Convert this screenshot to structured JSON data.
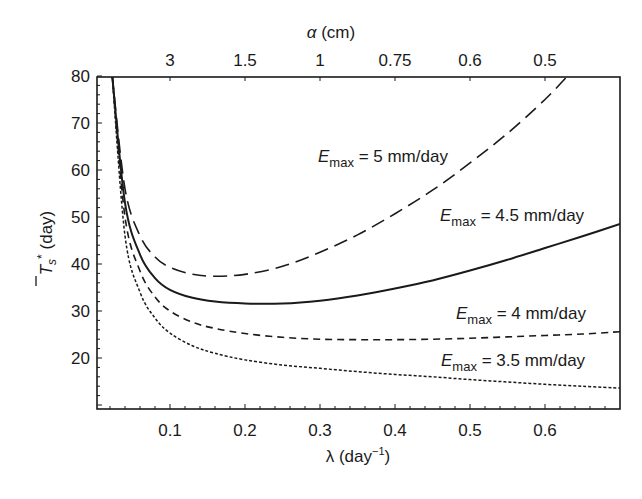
{
  "chart_data": {
    "type": "line",
    "title": "",
    "xlabel": "λ (day⁻¹)",
    "ylabel": "T̄s* (day)",
    "top_xlabel": "α (cm)",
    "xlim": [
      0.003,
      0.7
    ],
    "ylim": [
      9.3,
      80
    ],
    "grid": false,
    "legend_position": "inline labels",
    "x_ticks": [
      0.1,
      0.2,
      0.3,
      0.4,
      0.5,
      0.6
    ],
    "x_tick_labels": [
      "0.1",
      "0.2",
      "0.3",
      "0.4",
      "0.5",
      "0.6"
    ],
    "y_ticks": [
      20,
      30,
      40,
      50,
      60,
      70,
      80
    ],
    "y_tick_labels": [
      "20",
      "30",
      "40",
      "50",
      "60",
      "70",
      "80"
    ],
    "top_x_tick_labels": [
      "3",
      "1.5",
      "1",
      "0.75",
      "0.6",
      "0.5"
    ],
    "series": [
      {
        "name": "Emax = 5 mm/day",
        "style": "long-dash",
        "x": [
          0.023,
          0.04,
          0.06,
          0.08,
          0.1,
          0.13,
          0.16,
          0.2,
          0.25,
          0.3,
          0.35,
          0.4,
          0.45,
          0.5,
          0.55,
          0.6,
          0.63
        ],
        "y": [
          80,
          56,
          46,
          41.5,
          39.3,
          37.8,
          37.4,
          37.8,
          39.5,
          42.5,
          46.2,
          50.7,
          55.7,
          61.5,
          67.8,
          75,
          80
        ]
      },
      {
        "name": "Emax = 4.5 mm/day",
        "style": "solid",
        "x": [
          0.023,
          0.04,
          0.06,
          0.08,
          0.1,
          0.13,
          0.16,
          0.2,
          0.25,
          0.3,
          0.35,
          0.4,
          0.45,
          0.5,
          0.55,
          0.6,
          0.65,
          0.7
        ],
        "y": [
          80,
          53,
          42,
          37,
          34.5,
          32.8,
          32,
          31.6,
          31.6,
          32.2,
          33.3,
          34.8,
          36.5,
          38.6,
          40.9,
          43.4,
          45.9,
          48.5
        ]
      },
      {
        "name": "Emax = 4 mm/day",
        "style": "short-dash",
        "x": [
          0.023,
          0.04,
          0.06,
          0.08,
          0.1,
          0.13,
          0.16,
          0.2,
          0.25,
          0.3,
          0.35,
          0.4,
          0.45,
          0.5,
          0.55,
          0.6,
          0.65,
          0.7
        ],
        "y": [
          80,
          50,
          38.5,
          33,
          30,
          27.6,
          26.3,
          25.2,
          24.4,
          24,
          23.9,
          23.9,
          24,
          24.2,
          24.5,
          24.8,
          25.1,
          25.6
        ]
      },
      {
        "name": "Emax = 3.5 mm/day",
        "style": "dotted",
        "x": [
          0.023,
          0.04,
          0.06,
          0.08,
          0.1,
          0.13,
          0.16,
          0.2,
          0.25,
          0.3,
          0.35,
          0.4,
          0.45,
          0.5,
          0.55,
          0.6,
          0.65,
          0.7
        ],
        "y": [
          80,
          46,
          34,
          28.5,
          25.3,
          22.6,
          21,
          19.6,
          18.5,
          17.8,
          17.1,
          16.5,
          16,
          15.4,
          14.9,
          14.4,
          14,
          13.6
        ]
      }
    ]
  },
  "labels": {
    "top_axis_title": "α (cm)",
    "top_axis_alpha": "α",
    "top_axis_unit": " (cm)",
    "bottom_axis_lambda": "λ",
    "bottom_axis_unit": " (day",
    "bottom_axis_exp": "−1",
    "bottom_axis_close": ")",
    "y_axis_T": "T",
    "y_axis_sub": "s",
    "y_axis_star": "*",
    "y_axis_unit": " (day)",
    "E": "E",
    "max": "max",
    "series_5": " = 5 mm/day",
    "series_45": " = 4.5 mm/day",
    "series_4": " = 4 mm/day",
    "series_35": " = 3.5 mm/day"
  }
}
